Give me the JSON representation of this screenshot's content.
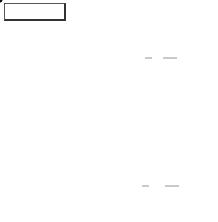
{
  "figure": {
    "label": "FIGURE 13"
  },
  "axes": {
    "x_label": "x",
    "y_label": "y",
    "x_ticks": [
      {
        "value": -2,
        "label": ""
      },
      {
        "value": 1,
        "label": "1"
      },
      {
        "value": 2,
        "label": "2"
      }
    ],
    "y_ticks": [
      {
        "value": 2,
        "label": "2"
      },
      {
        "value": 1,
        "label": "1"
      },
      {
        "value": -2,
        "label": ""
      }
    ]
  },
  "curves": [
    {
      "name": "circle-centered-origin",
      "center": [
        0,
        0
      ],
      "radius": 1
    },
    {
      "name": "circle-centered-one",
      "center": [
        1,
        0
      ],
      "radius": 1
    }
  ],
  "region": {
    "description": "shaded lens-shaped intersection of the two circles",
    "fill_color": "#d4d4d4",
    "border_color": "#111111"
  },
  "points": [
    {
      "name": "upper-intersection",
      "coords": [
        0.5,
        0.866
      ],
      "label_open": "(",
      "x_num": "1",
      "x_den": "2",
      "sep": ",",
      "y_sign": "",
      "y_num": "√3",
      "y_den": "2",
      "label_close": ")"
    },
    {
      "name": "lower-intersection",
      "coords": [
        0.5,
        -0.866
      ],
      "label_open": "(",
      "x_num": "1",
      "x_den": "2",
      "sep": ",",
      "y_sign": "−",
      "y_num": "√3",
      "y_den": "2",
      "label_close": ")"
    }
  ]
}
